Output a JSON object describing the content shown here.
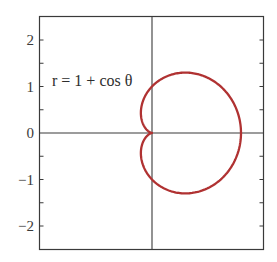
{
  "chart_data": {
    "type": "line",
    "subtype": "polar-curve-cartesian",
    "title": "",
    "xlabel": "",
    "ylabel": "",
    "annotation": "r = 1 + cos θ",
    "equation": {
      "r": "1 + cos(theta)",
      "theta_range": [
        0,
        6.283185
      ]
    },
    "xlim": [
      -2.55,
      2.5
    ],
    "ylim": [
      -2.5,
      2.5
    ],
    "yticks": [
      -2,
      -1,
      0,
      1,
      2
    ],
    "ytick_labels": [
      "−2",
      "−1",
      "0",
      "1",
      "2"
    ],
    "minor_ytick_step": 0.5,
    "xticks": [],
    "grid": false,
    "axes_lines": {
      "x0": true,
      "y0": true
    },
    "legend": null,
    "series": [
      {
        "name": "r = 1 + cos θ",
        "color": "#b03232",
        "key_points": [
          {
            "theta_deg": 0,
            "x": 2.0,
            "y": 0.0
          },
          {
            "theta_deg": 60,
            "x": 0.75,
            "y": 1.299
          },
          {
            "theta_deg": 90,
            "x": 0.0,
            "y": 1.0
          },
          {
            "theta_deg": 120,
            "x": -0.25,
            "y": 0.433
          },
          {
            "theta_deg": 180,
            "x": 0.0,
            "y": 0.0
          },
          {
            "theta_deg": 240,
            "x": -0.25,
            "y": -0.433
          },
          {
            "theta_deg": 270,
            "x": 0.0,
            "y": -1.0
          },
          {
            "theta_deg": 300,
            "x": 0.75,
            "y": -1.299
          }
        ]
      }
    ]
  },
  "colors": {
    "curve": "#b03232",
    "frame": "#3a3a3a",
    "axis": "#3a3a3a"
  }
}
